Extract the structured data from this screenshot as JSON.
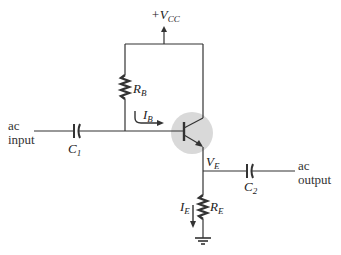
{
  "diagram": {
    "type": "emitter-follower circuit (common-collector)",
    "supply": {
      "prefix": "+V",
      "sub": "CC"
    },
    "labels": {
      "ac_input_line1": "ac",
      "ac_input_line2": "input",
      "ac_output_line1": "ac",
      "ac_output_line2": "output",
      "c1": {
        "main": "C",
        "sub": "1"
      },
      "c2": {
        "main": "C",
        "sub": "2"
      },
      "rb": {
        "main": "R",
        "sub": "B"
      },
      "re": {
        "main": "R",
        "sub": "E"
      },
      "ib": {
        "main": "I",
        "sub": "B"
      },
      "ie": {
        "main": "I",
        "sub": "E"
      },
      "ve": {
        "main": "V",
        "sub": "E"
      }
    },
    "components": [
      {
        "id": "C1",
        "kind": "capacitor",
        "role": "input coupling"
      },
      {
        "id": "RB",
        "kind": "resistor",
        "role": "base bias"
      },
      {
        "id": "Q",
        "kind": "npn-transistor",
        "role": "highlighted"
      },
      {
        "id": "RE",
        "kind": "resistor",
        "role": "emitter"
      },
      {
        "id": "C2",
        "kind": "capacitor",
        "role": "output coupling"
      },
      {
        "id": "GND",
        "kind": "ground"
      }
    ],
    "colors": {
      "wire": "#333333",
      "transistor_highlight": "#d9d9d9",
      "background": "#ffffff"
    }
  }
}
